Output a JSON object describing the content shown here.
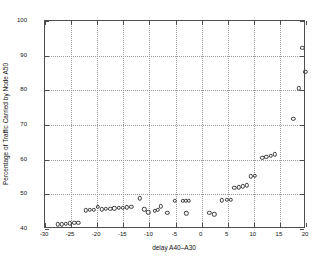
{
  "figure": {
    "background": "#ffffff",
    "frame_color": "#4d4d4d",
    "grid_color": "#9a9a9a",
    "marker_color": "#3a3a3a"
  },
  "chart_data": {
    "type": "scatter",
    "title": "",
    "xlabel": "delay A40–A30",
    "ylabel": "Percentage of Traffic Carried by Node A50",
    "xlim": [
      -30,
      20
    ],
    "ylim": [
      40,
      100
    ],
    "xticks": [
      -30,
      -25,
      -20,
      -15,
      -10,
      -5,
      0,
      5,
      10,
      15,
      20
    ],
    "xticklabels": [
      "-30",
      "-25",
      "-20",
      "-15",
      "-10",
      "-5",
      "0",
      "5",
      "10",
      "15",
      "20"
    ],
    "yticks": [
      40,
      50,
      60,
      70,
      80,
      90,
      100
    ],
    "yticklabels": [
      "40",
      "50",
      "60",
      "70",
      "80",
      "90",
      "100"
    ],
    "grid": true,
    "legend": null,
    "marker": "o",
    "marker_filled": false,
    "points": [
      {
        "x": -27.6,
        "y": 41.3
      },
      {
        "x": -26.8,
        "y": 41.4
      },
      {
        "x": -26.0,
        "y": 41.5
      },
      {
        "x": -25.2,
        "y": 41.6
      },
      {
        "x": -24.4,
        "y": 41.7
      },
      {
        "x": -23.6,
        "y": 41.8
      },
      {
        "x": -22.2,
        "y": 45.4
      },
      {
        "x": -21.4,
        "y": 45.5
      },
      {
        "x": -20.6,
        "y": 45.6
      },
      {
        "x": -19.9,
        "y": 46.4
      },
      {
        "x": -19.1,
        "y": 45.7
      },
      {
        "x": -18.3,
        "y": 45.8
      },
      {
        "x": -17.5,
        "y": 45.9
      },
      {
        "x": -16.7,
        "y": 46.0
      },
      {
        "x": -15.9,
        "y": 46.1
      },
      {
        "x": -15.1,
        "y": 46.2
      },
      {
        "x": -14.3,
        "y": 46.3
      },
      {
        "x": -13.5,
        "y": 46.4
      },
      {
        "x": -11.8,
        "y": 48.8
      },
      {
        "x": -11.0,
        "y": 45.7
      },
      {
        "x": -10.2,
        "y": 44.8
      },
      {
        "x": -9.0,
        "y": 45.3
      },
      {
        "x": -8.4,
        "y": 45.6
      },
      {
        "x": -7.8,
        "y": 46.6
      },
      {
        "x": -6.6,
        "y": 44.6
      },
      {
        "x": -5.1,
        "y": 48.1
      },
      {
        "x": -3.6,
        "y": 48.2
      },
      {
        "x": -3.0,
        "y": 48.2
      },
      {
        "x": -2.4,
        "y": 48.2
      },
      {
        "x": -2.9,
        "y": 44.5
      },
      {
        "x": 1.5,
        "y": 44.7
      },
      {
        "x": 2.4,
        "y": 44.2
      },
      {
        "x": 3.9,
        "y": 48.3
      },
      {
        "x": 4.8,
        "y": 48.4
      },
      {
        "x": 5.6,
        "y": 48.5
      },
      {
        "x": 6.3,
        "y": 51.8
      },
      {
        "x": 7.1,
        "y": 52.0
      },
      {
        "x": 7.9,
        "y": 52.3
      },
      {
        "x": 8.7,
        "y": 52.6
      },
      {
        "x": 9.4,
        "y": 55.2
      },
      {
        "x": 10.2,
        "y": 55.4
      },
      {
        "x": 11.6,
        "y": 60.6
      },
      {
        "x": 12.4,
        "y": 60.9
      },
      {
        "x": 13.2,
        "y": 61.2
      },
      {
        "x": 14.0,
        "y": 61.5
      },
      {
        "x": 17.6,
        "y": 71.8
      },
      {
        "x": 18.6,
        "y": 80.6
      },
      {
        "x": 19.3,
        "y": 92.3
      },
      {
        "x": 19.9,
        "y": 85.3
      }
    ]
  }
}
